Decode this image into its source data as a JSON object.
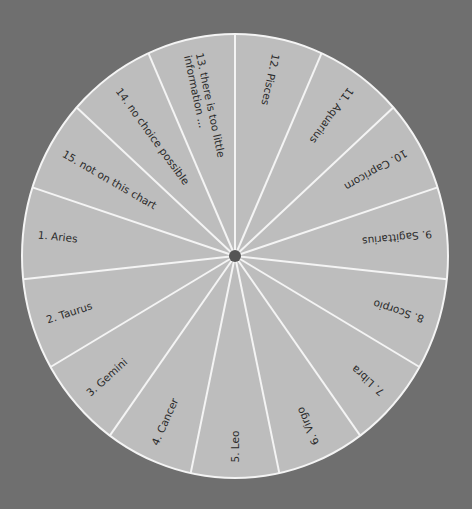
{
  "wheel": {
    "center": [
      235,
      256
    ],
    "rx": 213,
    "ry": 222,
    "segment_count": 15,
    "background_color": "#6f6f6f",
    "fill_color": "#bdbdbd",
    "line_color": "#f4f4f4",
    "hub_color": "#555555",
    "segments": [
      {
        "label": "1.  Aries"
      },
      {
        "label": "2.  Taurus"
      },
      {
        "label": "3.  Gemini"
      },
      {
        "label": "4.  Cancer"
      },
      {
        "label": "5.  Leo"
      },
      {
        "label": "6.  Virgo"
      },
      {
        "label": "7.  Libra"
      },
      {
        "label": "8.  Scorpio"
      },
      {
        "label": "9.  Sagittarius"
      },
      {
        "label": "10.  Capricorn"
      },
      {
        "label": "11.  Aquarius"
      },
      {
        "label": "12.  Pisces"
      },
      {
        "label": "13.  there is too little",
        "label2": "information ..."
      },
      {
        "label": "14.  no choice possible"
      },
      {
        "label": "15.  not on this chart"
      }
    ]
  }
}
